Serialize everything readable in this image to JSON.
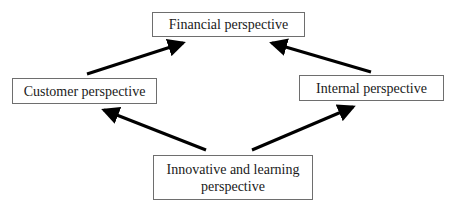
{
  "diagram": {
    "nodes": {
      "financial": {
        "label": "Financial perspective"
      },
      "customer": {
        "label": "Customer perspective"
      },
      "internal": {
        "label": "Internal perspective"
      },
      "innovative": {
        "label": "Innovative and learning\nperspective"
      }
    },
    "edges": [
      {
        "from": "customer",
        "to": "financial"
      },
      {
        "from": "internal",
        "to": "financial"
      },
      {
        "from": "innovative",
        "to": "customer"
      },
      {
        "from": "innovative",
        "to": "internal"
      }
    ],
    "colors": {
      "arrow": "#000000",
      "box_border": "#6e6e6e",
      "background": "#ffffff"
    }
  }
}
